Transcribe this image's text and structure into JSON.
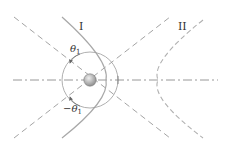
{
  "diagram": {
    "labels": {
      "branch_1": "I",
      "branch_2": "II",
      "theta_pos": "θ",
      "theta_pos_sub": "1",
      "theta_neg": "−θ",
      "theta_neg_sub": "1"
    },
    "colors": {
      "line": "#9a9a9a",
      "curve": "#a8a8a8",
      "text": "#333333",
      "sphere": "#b5b5b5",
      "sphere_highlight": "#e8e8e8"
    }
  }
}
